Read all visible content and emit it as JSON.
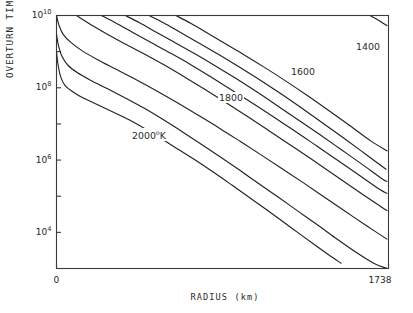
{
  "chart_data": {
    "type": "line",
    "title": "",
    "xlabel": "RADIUS  (km)",
    "ylabel": "OVERTURN TIME  (yr)",
    "xlim": [
      0,
      1738
    ],
    "ylim": [
      1000,
      10000000000
    ],
    "yscale": "log",
    "xscale": "linear",
    "grid": false,
    "legend_position": "inline-contour-labels",
    "xticks": [
      {
        "value": 0,
        "label": "0"
      },
      {
        "value": 1738,
        "label": "1738"
      }
    ],
    "yticks": [
      {
        "value": 10000000000,
        "label": "10",
        "exponent": "10"
      },
      {
        "value": 1000000000,
        "label": "",
        "exponent": ""
      },
      {
        "value": 100000000,
        "label": "10",
        "exponent": "8"
      },
      {
        "value": 10000000,
        "label": "",
        "exponent": ""
      },
      {
        "value": 1000000,
        "label": "10",
        "exponent": "6"
      },
      {
        "value": 100000,
        "label": "",
        "exponent": ""
      },
      {
        "value": 10000,
        "label": "10",
        "exponent": "4"
      }
    ],
    "contour_labels": [
      {
        "text": "2000",
        "sup": "o",
        "unit": "K",
        "x_px": 131,
        "y_px": 128
      },
      {
        "text": "1800",
        "sup": "",
        "unit": "",
        "x_px": 218,
        "y_px": 92
      },
      {
        "text": "1600",
        "sup": "",
        "unit": "",
        "x_px": 290,
        "y_px": 66
      },
      {
        "text": "1400",
        "sup": "",
        "unit": "",
        "x_px": 355,
        "y_px": 41
      }
    ],
    "series": [
      {
        "name": "2000K",
        "label": "2000 K",
        "points": [
          [
            0,
            1000000000
          ],
          [
            8,
            440000000
          ],
          [
            22,
            200000000
          ],
          [
            45,
            115000000
          ],
          [
            85,
            78000000
          ],
          [
            140,
            52000000
          ],
          [
            210,
            35000000
          ],
          [
            290,
            22000000
          ],
          [
            380,
            13000000
          ],
          [
            470,
            7000000
          ],
          [
            560,
            3600000
          ],
          [
            650,
            1800000
          ],
          [
            740,
            900000
          ],
          [
            830,
            430000
          ],
          [
            920,
            200000
          ],
          [
            1010,
            92000
          ],
          [
            1100,
            42000
          ],
          [
            1190,
            19000
          ],
          [
            1280,
            8500
          ],
          [
            1360,
            4200
          ],
          [
            1430,
            2300
          ],
          [
            1490,
            1400
          ]
        ]
      },
      {
        "name": "curve2",
        "label": "",
        "points": [
          [
            0,
            3000000000
          ],
          [
            10,
            1500000000
          ],
          [
            28,
            760000000
          ],
          [
            60,
            420000000
          ],
          [
            110,
            260000000
          ],
          [
            180,
            160000000
          ],
          [
            265,
            95000000
          ],
          [
            360,
            52000000
          ],
          [
            460,
            27000000
          ],
          [
            560,
            13000000
          ],
          [
            660,
            6000000
          ],
          [
            760,
            2700000
          ],
          [
            860,
            1200000
          ],
          [
            960,
            520000
          ],
          [
            1060,
            220000
          ],
          [
            1160,
            95000
          ],
          [
            1260,
            40000
          ],
          [
            1360,
            17000
          ],
          [
            1460,
            7000
          ],
          [
            1560,
            3000
          ],
          [
            1660,
            1400
          ],
          [
            1730,
            1000
          ]
        ]
      },
      {
        "name": "curve3",
        "label": "",
        "points": [
          [
            0,
            10000000000
          ],
          [
            12,
            5600000000
          ],
          [
            35,
            3000000000
          ],
          [
            75,
            1800000000
          ],
          [
            135,
            1050000000
          ],
          [
            215,
            600000000
          ],
          [
            310,
            330000000
          ],
          [
            415,
            170000000
          ],
          [
            525,
            82000000
          ],
          [
            635,
            38000000
          ],
          [
            745,
            17000000
          ],
          [
            855,
            7500000
          ],
          [
            965,
            3200000
          ],
          [
            1075,
            1350000
          ],
          [
            1185,
            560000
          ],
          [
            1295,
            230000
          ],
          [
            1405,
            92000
          ],
          [
            1515,
            37000
          ],
          [
            1625,
            15000
          ],
          [
            1730,
            6500
          ]
        ]
      },
      {
        "name": "curve4",
        "label": "1800",
        "points": [
          [
            105,
            10000000000
          ],
          [
            170,
            6000000000
          ],
          [
            250,
            3400000000
          ],
          [
            345,
            1800000000
          ],
          [
            450,
            920000000
          ],
          [
            560,
            440000000
          ],
          [
            670,
            200000000
          ],
          [
            780,
            88000000
          ],
          [
            890,
            38000000
          ],
          [
            1000,
            16000000
          ],
          [
            1110,
            6600000
          ],
          [
            1220,
            2700000
          ],
          [
            1330,
            1100000
          ],
          [
            1440,
            440000
          ],
          [
            1550,
            175000
          ],
          [
            1660,
            70000
          ],
          [
            1730,
            40000
          ]
        ]
      },
      {
        "name": "curve5",
        "label": "1600",
        "points": [
          [
            235,
            10000000000
          ],
          [
            310,
            6200000000
          ],
          [
            395,
            3500000000
          ],
          [
            490,
            1850000000
          ],
          [
            595,
            920000000
          ],
          [
            705,
            430000000
          ],
          [
            815,
            190000000
          ],
          [
            925,
            82000000
          ],
          [
            1035,
            35000000
          ],
          [
            1145,
            14500000
          ],
          [
            1255,
            6000000
          ],
          [
            1365,
            2400000
          ],
          [
            1475,
            960000
          ],
          [
            1585,
            380000
          ],
          [
            1695,
            150000
          ],
          [
            1730,
            120000
          ]
        ]
      },
      {
        "name": "curve6",
        "label": "",
        "points": [
          [
            360,
            10000000000
          ],
          [
            435,
            6300000000
          ],
          [
            520,
            3500000000
          ],
          [
            615,
            1850000000
          ],
          [
            720,
            900000000
          ],
          [
            830,
            410000000
          ],
          [
            940,
            180000000
          ],
          [
            1050,
            76000000
          ],
          [
            1160,
            31000000
          ],
          [
            1270,
            12500000
          ],
          [
            1380,
            5000000
          ],
          [
            1490,
            1950000
          ],
          [
            1600,
            760000
          ],
          [
            1710,
            290000
          ],
          [
            1730,
            260000
          ]
        ]
      },
      {
        "name": "curve7",
        "label": "1400",
        "points": [
          [
            485,
            10000000000
          ],
          [
            560,
            6300000000
          ],
          [
            645,
            3500000000
          ],
          [
            740,
            1800000000
          ],
          [
            845,
            860000000
          ],
          [
            955,
            380000000
          ],
          [
            1065,
            165000000
          ],
          [
            1175,
            68000000
          ],
          [
            1285,
            27000000
          ],
          [
            1395,
            10500000
          ],
          [
            1505,
            4000000
          ],
          [
            1615,
            1500000
          ],
          [
            1725,
            560000
          ]
        ]
      },
      {
        "name": "curve8",
        "label": "",
        "points": [
          [
            625,
            10000000000
          ],
          [
            700,
            6200000000
          ],
          [
            785,
            3400000000
          ],
          [
            880,
            1700000000
          ],
          [
            985,
            800000000
          ],
          [
            1095,
            350000000
          ],
          [
            1205,
            148000000
          ],
          [
            1315,
            60000000
          ],
          [
            1425,
            23500000
          ],
          [
            1535,
            9000000
          ],
          [
            1645,
            3400000
          ],
          [
            1730,
            1800000
          ]
        ]
      },
      {
        "name": "curve9",
        "label": "",
        "points": [
          [
            1640,
            10000000000
          ],
          [
            1690,
            7200000000
          ],
          [
            1730,
            5200000000
          ]
        ]
      }
    ]
  },
  "axis": {
    "frame_color": "#3a3a3a"
  }
}
